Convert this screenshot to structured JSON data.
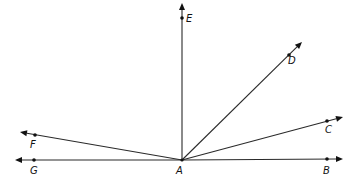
{
  "diagram": {
    "type": "rays-from-common-endpoint",
    "vertex": {
      "label": "A",
      "x": 182,
      "y": 160,
      "label_x": 176,
      "label_y": 174
    },
    "colors": {
      "line": "#2a2a2a",
      "point": "#111111",
      "background": "#ffffff"
    },
    "rays": [
      {
        "name": "ray-AB",
        "label": "B",
        "point": {
          "x": 327,
          "y": 159
        },
        "tip": {
          "x": 343,
          "y": 159
        },
        "label_x": 323,
        "label_y": 174
      },
      {
        "name": "ray-AC",
        "label": "C",
        "point": {
          "x": 327,
          "y": 121
        },
        "tip": {
          "x": 343,
          "y": 117
        },
        "label_x": 325,
        "label_y": 133
      },
      {
        "name": "ray-AD",
        "label": "D",
        "point": {
          "x": 289,
          "y": 55
        },
        "tip": {
          "x": 302,
          "y": 42
        },
        "label_x": 288,
        "label_y": 64
      },
      {
        "name": "ray-AE",
        "label": "E",
        "point": {
          "x": 182,
          "y": 18
        },
        "tip": {
          "x": 182,
          "y": 3
        },
        "label_x": 186,
        "label_y": 22
      },
      {
        "name": "ray-AF",
        "label": "F",
        "point": {
          "x": 35,
          "y": 135
        },
        "tip": {
          "x": 20,
          "y": 132
        },
        "label_x": 30,
        "label_y": 148
      },
      {
        "name": "ray-AG",
        "label": "G",
        "point": {
          "x": 34,
          "y": 160
        },
        "tip": {
          "x": 15,
          "y": 160
        },
        "label_x": 30,
        "label_y": 174
      }
    ]
  }
}
